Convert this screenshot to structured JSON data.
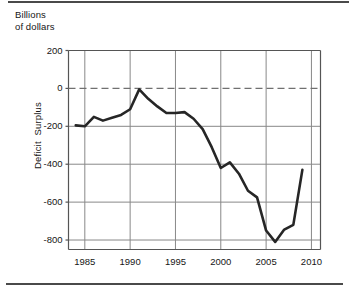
{
  "figure": {
    "title_line1": "Billions",
    "title_line2": "of dollars",
    "y_axis_label": "Deficit  Surplus",
    "rule_color": "#4a4a4a",
    "grid_color": "#888888",
    "frame_color": "#555555",
    "line_color": "#262626",
    "background": "#ffffff"
  },
  "chart_data": {
    "type": "line",
    "xlabel": "",
    "ylabel": "Deficit  Surplus",
    "grid": true,
    "legend": "none",
    "xlim": [
      1983.2,
      2011.0
    ],
    "ylim": [
      -850,
      200
    ],
    "yticks": [
      200,
      0,
      -200,
      -400,
      -600,
      -800
    ],
    "ytick_labels": [
      "200",
      "0",
      "-200",
      "-400",
      "-600",
      "-800"
    ],
    "xticks": [
      1985,
      1990,
      1995,
      2000,
      2005,
      2010
    ],
    "xtick_labels": [
      "1985",
      "1990",
      "1995",
      "2000",
      "2005",
      "2010"
    ],
    "zero_reference_line": {
      "value": 0,
      "style": "dashed"
    },
    "series": [
      {
        "name": "Federal budget surplus or deficit",
        "x": [
          1984,
          1985,
          1986,
          1987,
          1988,
          1989,
          1990,
          1991,
          1992,
          1993,
          1994,
          1995,
          1996,
          1997,
          1998,
          1999,
          2000,
          2001,
          2002,
          2003,
          2004,
          2005,
          2006,
          2007,
          2008,
          2009
        ],
        "values": [
          -195,
          -200,
          -150,
          -170,
          -155,
          -140,
          -110,
          -5,
          -55,
          -95,
          -130,
          -130,
          -125,
          -160,
          -215,
          -310,
          -420,
          -390,
          -450,
          -540,
          -575,
          -750,
          -810,
          -745,
          -720,
          -430
        ]
      }
    ]
  }
}
